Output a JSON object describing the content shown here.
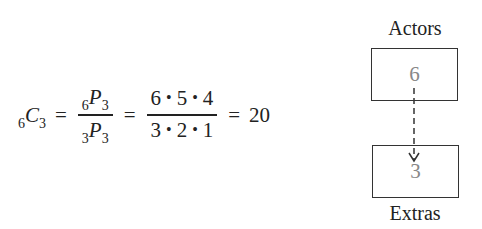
{
  "equation": {
    "lhs": {
      "symbol": "C",
      "pre_subscript": "6",
      "subscript": "3"
    },
    "fraction1": {
      "numerator": {
        "symbol": "P",
        "pre_subscript": "6",
        "subscript": "3"
      },
      "denominator": {
        "symbol": "P",
        "pre_subscript": "3",
        "subscript": "3"
      }
    },
    "fraction2": {
      "numerator": [
        "6",
        "5",
        "4"
      ],
      "denominator": [
        "3",
        "2",
        "1"
      ],
      "operator": "•"
    },
    "equals": "=",
    "result": "20"
  },
  "diagram": {
    "top_label": "Actors",
    "top_value": "6",
    "bottom_label": "Extras",
    "bottom_value": "3",
    "arrow_style": "dashed"
  }
}
